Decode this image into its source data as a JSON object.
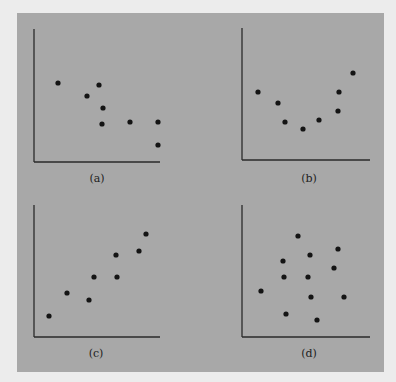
{
  "figure": {
    "background_color": "#ececec",
    "panel_color": "#a8a8a8",
    "axis_color": "#2a2a2a",
    "point_color": "#141414"
  },
  "chart_data": [
    {
      "type": "scatter",
      "label": "(a)",
      "pattern": "negative linear",
      "points": [
        [
          58,
          83
        ],
        [
          99,
          85
        ],
        [
          87,
          96
        ],
        [
          103,
          108
        ],
        [
          102,
          124
        ],
        [
          130,
          122
        ],
        [
          158,
          122
        ],
        [
          158,
          145
        ]
      ]
    },
    {
      "type": "scatter",
      "label": "(b)",
      "pattern": "curvilinear (U-shaped)",
      "points": [
        [
          258,
          92
        ],
        [
          278,
          103
        ],
        [
          285,
          122
        ],
        [
          303,
          129
        ],
        [
          319,
          120
        ],
        [
          338,
          111
        ],
        [
          339,
          92
        ],
        [
          353,
          73
        ]
      ]
    },
    {
      "type": "scatter",
      "label": "(c)",
      "pattern": "positive linear",
      "points": [
        [
          49,
          316
        ],
        [
          67,
          293
        ],
        [
          89,
          300
        ],
        [
          94,
          277
        ],
        [
          116,
          255
        ],
        [
          117,
          277
        ],
        [
          139,
          251
        ],
        [
          146,
          234
        ]
      ]
    },
    {
      "type": "scatter",
      "label": "(d)",
      "pattern": "no relationship",
      "points": [
        [
          261,
          291
        ],
        [
          283,
          261
        ],
        [
          284,
          277
        ],
        [
          286,
          314
        ],
        [
          298,
          236
        ],
        [
          308,
          277
        ],
        [
          310,
          255
        ],
        [
          311,
          297
        ],
        [
          317,
          320
        ],
        [
          334,
          268
        ],
        [
          338,
          249
        ],
        [
          344,
          297
        ]
      ]
    }
  ]
}
